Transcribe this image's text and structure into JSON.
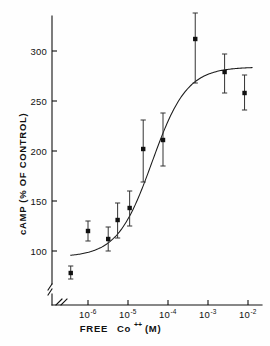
{
  "chart_data": {
    "type": "scatter",
    "title": "",
    "subtitle": "",
    "xlabel": "FREE Co++ (M)",
    "xlabel_parts": {
      "pre": "FREE",
      "ion": "Co",
      "charge": "++",
      "units": "(M)"
    },
    "ylabel": "cAMP (% OF CONTROL)",
    "xscale": "log",
    "yscale": "linear",
    "xlim": [
      3e-07,
      0.013
    ],
    "ylim": [
      70,
      320
    ],
    "ylim_break": true,
    "y_break_note": "axis break between baseline and first tick region",
    "grid": false,
    "legend": null,
    "x_ticks": [
      1e-06,
      1e-05,
      0.0001,
      0.001,
      0.01
    ],
    "x_tick_labels": [
      "10-6",
      "10-5",
      "10-4",
      "10-3",
      "10-2"
    ],
    "x_tick_mantissa": [
      "10",
      "10",
      "10",
      "10",
      "10"
    ],
    "x_tick_exponents": [
      "-6",
      "-5",
      "-4",
      "-3",
      "-2"
    ],
    "y_ticks": [
      100,
      150,
      200,
      250,
      300
    ],
    "y_tick_labels": [
      "100",
      "150",
      "200",
      "250",
      "300"
    ],
    "series": [
      {
        "name": "cAMP response",
        "marker": "square",
        "points": [
          {
            "x": 3.7e-07,
            "y": 78,
            "yerr_low": 72,
            "yerr_high": 85
          },
          {
            "x": 1e-06,
            "y": 120,
            "yerr_low": 110,
            "yerr_high": 130
          },
          {
            "x": 3.2e-06,
            "y": 112,
            "yerr_low": 100,
            "yerr_high": 124
          },
          {
            "x": 5.5e-06,
            "y": 131,
            "yerr_low": 113,
            "yerr_high": 148
          },
          {
            "x": 1.1e-05,
            "y": 143,
            "yerr_low": 125,
            "yerr_high": 160
          },
          {
            "x": 2.4e-05,
            "y": 202,
            "yerr_low": 169,
            "yerr_high": 231
          },
          {
            "x": 7.5e-05,
            "y": 211,
            "yerr_low": 185,
            "yerr_high": 238
          },
          {
            "x": 0.00048,
            "y": 312,
            "yerr_low": 268,
            "yerr_high": 338
          },
          {
            "x": 0.0026,
            "y": 279,
            "yerr_low": 258,
            "yerr_high": 297
          },
          {
            "x": 0.0082,
            "y": 258,
            "yerr_low": 241,
            "yerr_high": 276
          }
        ]
      }
    ],
    "fitted_curve": {
      "name": "sigmoid fit",
      "description": "sigmoidal dose-response fit",
      "bottom": 94,
      "top": 284,
      "ec50": 4e-05,
      "hill": 1.0
    }
  },
  "figure": {
    "axis_color": "#111111",
    "marker_color": "#111111",
    "curve_color": "#1a1a1a",
    "background": "#fefefe"
  }
}
